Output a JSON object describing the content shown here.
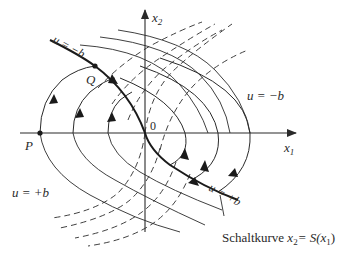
{
  "diagram": {
    "type": "phase-plane",
    "axes": {
      "x_label": "x",
      "x_label_sub": "1",
      "y_label": "x",
      "y_label_sub": "2",
      "origin_label": "0"
    },
    "points": {
      "P": "P",
      "Q": "Q"
    },
    "regions": {
      "upper_left_curve_label": "u = −b",
      "upper_right_label": "u = −b",
      "lower_left_label": "u = +b",
      "lower_right_curve_label": "u = +b"
    },
    "switching_curve": {
      "label_prefix": "Schaltkurve ",
      "label_x": "x",
      "label_x_sub": "2",
      "label_eq": "= S(x",
      "label_arg_sub": "1",
      "label_close": ")"
    },
    "colors": {
      "line": "#2a2a2a",
      "background": "#ffffff"
    }
  }
}
